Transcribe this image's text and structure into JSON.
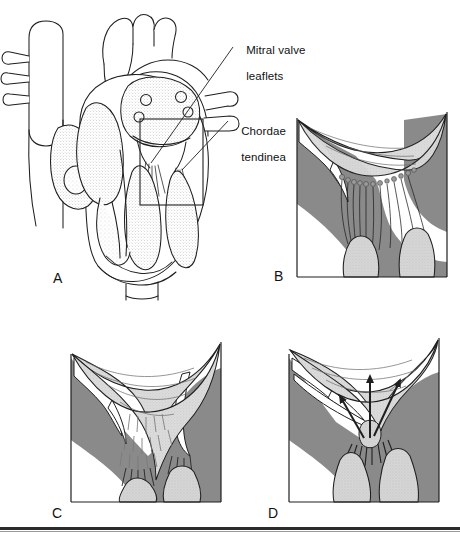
{
  "figure": {
    "panel_letters": [
      "A",
      "B",
      "C",
      "D"
    ],
    "labels": [
      {
        "id": "mitral-valve-leaflets",
        "line1": "Mitral valve",
        "line2": "leaflets"
      },
      {
        "id": "chordae-tendineae",
        "line1": "Chordae",
        "line2": "tendineae"
      }
    ],
    "panels": [
      {
        "letter": "A",
        "name": "whole-heart-coronal-section",
        "description": "Coronal section of the whole heart with great vessels, atria, ventricles and an inset box outlining the mitral valve region"
      },
      {
        "letter": "B",
        "name": "normal-mitral-valve",
        "description": "Close-up of normal mitral valve leaflets with fine chordae tendineae attaching to papillary muscles"
      },
      {
        "letter": "C",
        "name": "thickened-fused-leaflets",
        "description": "Thickened leaflets with shortened and fused chordae tendineae"
      },
      {
        "letter": "D",
        "name": "prolapsing-leaflets",
        "description": "Ruptured chordae with prolapsing leaflets, regurgitant flow shown by arrows"
      }
    ],
    "colors": {
      "myocardium": "#8a8a8a",
      "leaflet": "#dcdcdc",
      "papillary": "#d4d4d4",
      "outline": "#1f1f1f",
      "background": "#ffffff",
      "rule": "#2b2b2b"
    }
  }
}
